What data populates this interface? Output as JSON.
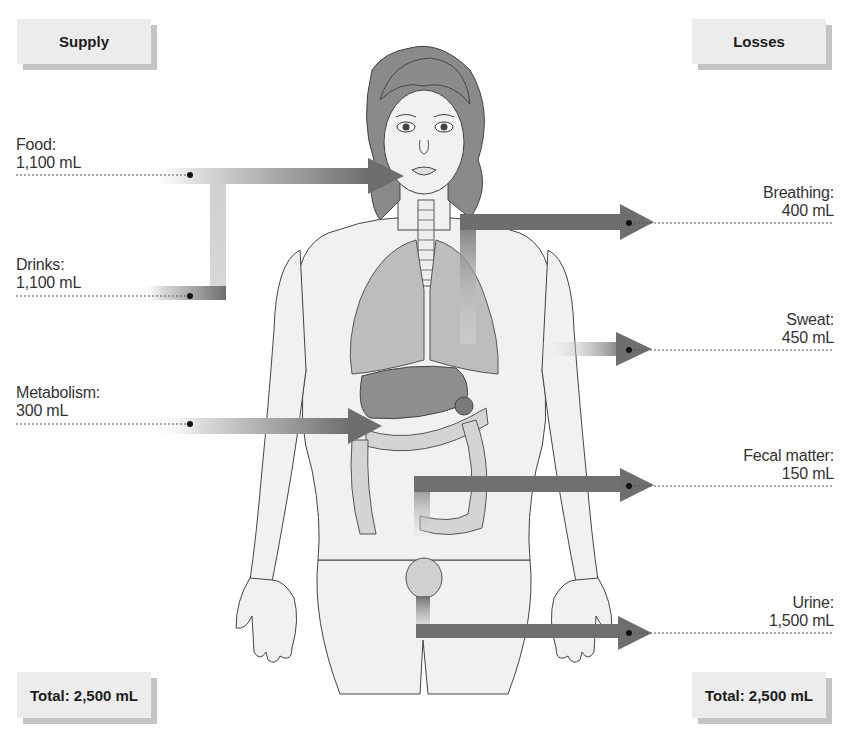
{
  "headers": {
    "supply": "Supply",
    "losses": "Losses"
  },
  "totals": {
    "supply": "Total: 2,500 mL",
    "losses": "Total: 2,500 mL"
  },
  "supply": [
    {
      "label": "Food:",
      "value": "1,100 mL"
    },
    {
      "label": "Drinks:",
      "value": "1,100 mL"
    },
    {
      "label": "Metabolism:",
      "value": "300 mL"
    }
  ],
  "losses": [
    {
      "label": "Breathing:",
      "value": "400 mL"
    },
    {
      "label": "Sweat:",
      "value": "450 mL"
    },
    {
      "label": "Fecal matter:",
      "value": "150 mL"
    },
    {
      "label": "Urine:",
      "value": "1,500 mL"
    }
  ],
  "colors": {
    "arrow_dark": "#6a6a6a",
    "arrow_light": "#e2e2e2",
    "header_bg": "#ececec",
    "header_shadow": "#c4c4c4",
    "hair": "#8a8a8a",
    "skin": "#f1f1f1",
    "organ": "#bdbdbd",
    "liver": "#8e8e8e"
  }
}
